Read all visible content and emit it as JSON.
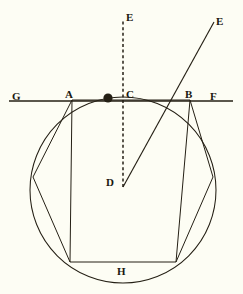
{
  "figure": {
    "kind": "geometry-diagram",
    "title": "",
    "background_color": "#fdfdf4",
    "ink_color": "#231f14",
    "labels": [
      {
        "id": "G",
        "text": "G",
        "x": 12,
        "y": 91,
        "role": "line-endpoint-left"
      },
      {
        "id": "A",
        "text": "A",
        "x": 65,
        "y": 89,
        "role": "tangent-intersection-left"
      },
      {
        "id": "C",
        "text": "C",
        "x": 126,
        "y": 89,
        "role": "top-of-circle"
      },
      {
        "id": "B",
        "text": "B",
        "x": 185,
        "y": 89,
        "role": "tangent-intersection-right"
      },
      {
        "id": "F",
        "text": "F",
        "x": 210,
        "y": 91,
        "role": "line-endpoint-right"
      },
      {
        "id": "E1",
        "text": "E",
        "x": 126,
        "y": 12,
        "role": "dashed-ray-endpoint"
      },
      {
        "id": "E2",
        "text": "E",
        "x": 216,
        "y": 16,
        "role": "solid-ray-endpoint"
      },
      {
        "id": "D",
        "text": "D",
        "x": 106,
        "y": 177,
        "role": "circle-center"
      },
      {
        "id": "H",
        "text": "H",
        "x": 117,
        "y": 266,
        "role": "bottom-chord-label"
      }
    ],
    "circle": {
      "cx": 123,
      "cy": 190,
      "r": 93
    },
    "marker_dot": {
      "cx": 108,
      "cy": 98,
      "r": 4.6,
      "fill": "#241f14"
    },
    "horizontal_line": {
      "x1": 9,
      "y1": 101,
      "x2": 233,
      "y2": 101,
      "label_left": "G",
      "label_right": "F"
    },
    "dashed_ray": {
      "x1": 123,
      "y1": 187,
      "x2": 123,
      "y2": 19,
      "label": "E"
    },
    "solid_ray": {
      "x1": 123,
      "y1": 187,
      "x2": 214,
      "y2": 22,
      "label": "E"
    },
    "chord_points": {
      "A": {
        "x": 72,
        "y": 100
      },
      "B": {
        "x": 190,
        "y": 100
      },
      "left_mid": {
        "x": 33,
        "y": 177
      },
      "right_mid": {
        "x": 213,
        "y": 177
      },
      "bottom_left": {
        "x": 70,
        "y": 262
      },
      "bottom_right": {
        "x": 176,
        "y": 262
      }
    }
  }
}
